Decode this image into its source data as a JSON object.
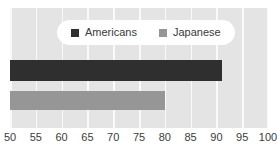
{
  "chart_data": {
    "type": "bar",
    "orientation": "horizontal",
    "title": "",
    "subtitle": "",
    "xlabel": "",
    "ylabel": "",
    "xlim": [
      50,
      100
    ],
    "xticks": [
      50,
      55,
      60,
      65,
      70,
      75,
      80,
      85,
      90,
      95,
      100
    ],
    "xtick_labels": [
      "50",
      "55",
      "60",
      "65",
      "70",
      "75",
      "80",
      "85",
      "90",
      "95",
      "100"
    ],
    "grid": "vertical",
    "legend_position": "top-center",
    "categories": [
      ""
    ],
    "series": [
      {
        "name": "Americans",
        "values": [
          91
        ],
        "color": "#2f2f2f"
      },
      {
        "name": "Japanese",
        "values": [
          80
        ],
        "color": "#969696"
      }
    ],
    "annotations": []
  },
  "legend": {
    "entries": [
      {
        "label": "Americans",
        "swatch": "legend-swatch-americans"
      },
      {
        "label": "Japanese",
        "swatch": "legend-swatch-japanese"
      }
    ]
  },
  "colors": {
    "plot_background": "#e4e4e4",
    "page_background": "#ffffff",
    "gridline": "#fafafa",
    "legend_background": "#ffffff",
    "tick_text": "#3c3c3c",
    "americans": "#2f2f2f",
    "japanese": "#969696"
  }
}
